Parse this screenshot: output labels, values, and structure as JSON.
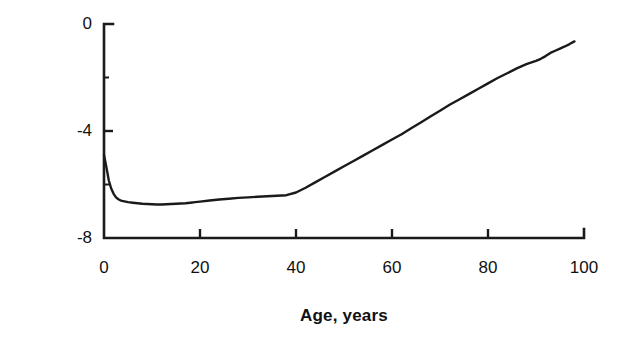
{
  "chart_data": {
    "type": "line",
    "title": "",
    "subtitle": "",
    "xlabel": "Age, years",
    "ylabel": "Log failure rate",
    "xlim": [
      0,
      100
    ],
    "ylim": [
      -8,
      0
    ],
    "xticks": [
      0,
      20,
      40,
      60,
      80,
      100
    ],
    "xtick_labels": [
      "0",
      "20",
      "40",
      "60",
      "80",
      "100"
    ],
    "yticks": [
      0,
      -4,
      -8
    ],
    "ytick_labels": [
      "0",
      "-4",
      "-8"
    ],
    "yminor_ticks": [
      -2,
      -6
    ],
    "grid": false,
    "legend": null,
    "annotations": [],
    "line_color": "#1a1a1a",
    "series": [
      {
        "name": "Log failure rate by age",
        "x": [
          0,
          0.5,
          1,
          1.5,
          2,
          2.5,
          3,
          3.5,
          4,
          5,
          6,
          7,
          8,
          9,
          10,
          11,
          12,
          13,
          14,
          15,
          16,
          17,
          18,
          19,
          20,
          22,
          24,
          26,
          28,
          30,
          32,
          34,
          36,
          38,
          40,
          42,
          44,
          46,
          48,
          50,
          52,
          54,
          56,
          58,
          60,
          62,
          64,
          66,
          68,
          70,
          72,
          74,
          76,
          78,
          80,
          82,
          84,
          86,
          88,
          90,
          91,
          92,
          93,
          94,
          95,
          96,
          97,
          98
        ],
        "y": [
          -4.9,
          -5.35,
          -5.85,
          -6.15,
          -6.35,
          -6.48,
          -6.55,
          -6.6,
          -6.62,
          -6.66,
          -6.68,
          -6.7,
          -6.72,
          -6.73,
          -6.74,
          -6.75,
          -6.75,
          -6.74,
          -6.73,
          -6.72,
          -6.71,
          -6.7,
          -6.68,
          -6.66,
          -6.64,
          -6.6,
          -6.56,
          -6.53,
          -6.5,
          -6.48,
          -6.46,
          -6.44,
          -6.42,
          -6.4,
          -6.3,
          -6.12,
          -5.92,
          -5.72,
          -5.52,
          -5.32,
          -5.12,
          -4.92,
          -4.72,
          -4.52,
          -4.32,
          -4.12,
          -3.9,
          -3.68,
          -3.46,
          -3.24,
          -3.02,
          -2.82,
          -2.62,
          -2.42,
          -2.22,
          -2.02,
          -1.84,
          -1.66,
          -1.5,
          -1.38,
          -1.3,
          -1.2,
          -1.08,
          -1.0,
          -0.92,
          -0.84,
          -0.75,
          -0.65
        ]
      }
    ]
  },
  "axes": {
    "x_tick_pixels": [
      104,
      200,
      296,
      392,
      488,
      584
    ],
    "y_tick_pixels": [
      24,
      131,
      238
    ]
  }
}
